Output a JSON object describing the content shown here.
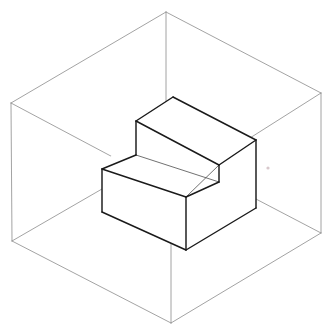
{
  "figure": {
    "projection": "isometric",
    "background_color": "#ffffff",
    "bounding_box": {
      "name": "wireframe-bounding-box",
      "stroke_color": "#8c8c8c",
      "stroke_width": 0.8,
      "style": "thin gray wireframe, all 12 edges visible",
      "vertices": {
        "top_back": "166,12",
        "top_left": "11,103",
        "top_right": "321,93",
        "top_front": "171,188",
        "bottom_left": "12,241",
        "bottom_right": "321,233",
        "bottom_front": "171,323",
        "bottom_back": "166,152"
      },
      "edges": [
        "top_back-top_left",
        "top_back-top_right",
        "top_left-top_front",
        "top_right-top_front",
        "top_left-bottom_left",
        "top_right-bottom_right",
        "top_front-bottom_front",
        "bottom_left-bottom_front",
        "bottom_right-bottom_front",
        "top_back-bottom_back",
        "bottom_back-bottom_left",
        "bottom_back-bottom_right"
      ]
    },
    "solid": {
      "name": "step-block",
      "description": "L-shaped stepped solid, two stacked rectangular tiers",
      "stroke_color": "#1a1a1a",
      "fill_color": "#ffffff",
      "stroke_width": 1.45,
      "upper_tier": {
        "name": "upper-step",
        "top_face_vertices": "136,121 173,97 256,140 219,165",
        "front_riser_vertices": "136,121 219,165 219,182 136,155"
      },
      "lower_tier": {
        "name": "lower-step",
        "top_face_vertices": "102,169 136,155 219,182 186,197",
        "left_face_vertices": "102,169 186,197 186,250 102,212",
        "right_face_vertices": "186,197 256,166 256,208 186,250"
      },
      "right_face_vertices": "219,165 256,140 256,208 219,182",
      "hidden_or_faint_edges": [
        "186,197 219,165",
        "136,155 219,182"
      ]
    },
    "artifacts": [
      {
        "name": "faint-speck",
        "position": "268,168",
        "color": "#d8c8cc",
        "radius": 1.6
      }
    ]
  }
}
